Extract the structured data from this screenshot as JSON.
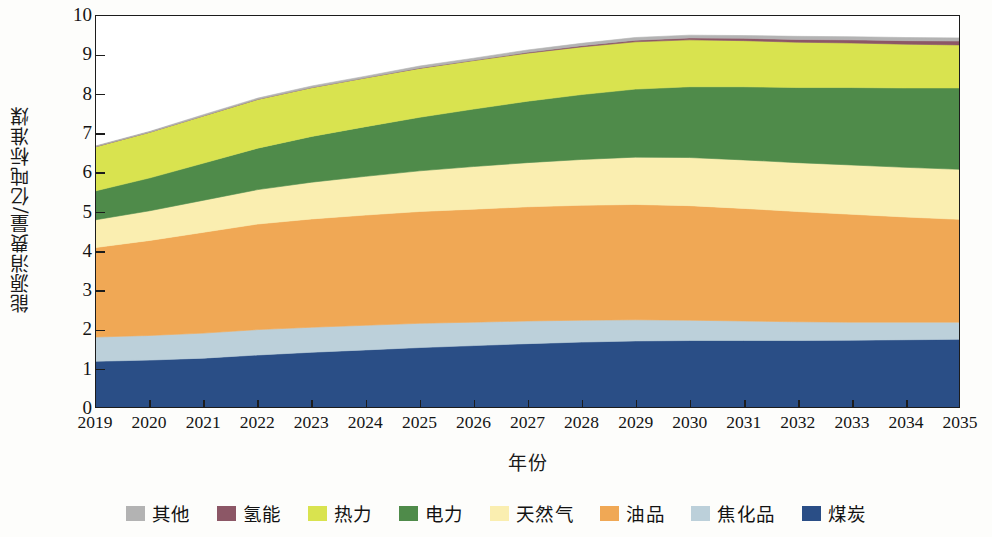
{
  "chart_data": {
    "type": "area",
    "title": "",
    "xlabel": "年份",
    "ylabel": "能源消费量/亿吨标准煤",
    "xlim": [
      2019,
      2035
    ],
    "ylim": [
      0,
      10
    ],
    "ytick_step": 1,
    "grid": false,
    "stacked": true,
    "legend_position": "bottom",
    "x": [
      2019,
      2020,
      2021,
      2022,
      2023,
      2024,
      2025,
      2026,
      2027,
      2028,
      2029,
      2030,
      2031,
      2032,
      2033,
      2034,
      2035
    ],
    "xtick_labels": [
      "2019",
      "2020",
      "2021",
      "2022",
      "2023",
      "2024",
      "2025",
      "2026",
      "2027",
      "2028",
      "2029",
      "2030",
      "2031",
      "2032",
      "2033",
      "2034",
      "2035"
    ],
    "ytick_labels": [
      "0",
      "1",
      "2",
      "3",
      "4",
      "5",
      "6",
      "7",
      "8",
      "9",
      "10"
    ],
    "stack_order_bottom_to_top": [
      "煤炭",
      "焦化品",
      "油品",
      "天然气",
      "电力",
      "热力",
      "氢能",
      "其他"
    ],
    "series": [
      {
        "name": "煤炭",
        "color": "#2a4e86",
        "values": [
          1.17,
          1.2,
          1.25,
          1.33,
          1.4,
          1.46,
          1.52,
          1.57,
          1.62,
          1.66,
          1.69,
          1.7,
          1.7,
          1.7,
          1.71,
          1.72,
          1.73
        ]
      },
      {
        "name": "焦化品",
        "color": "#bcd0da",
        "values": [
          0.62,
          0.63,
          0.64,
          0.65,
          0.64,
          0.63,
          0.62,
          0.6,
          0.58,
          0.56,
          0.54,
          0.52,
          0.5,
          0.48,
          0.46,
          0.45,
          0.44
        ]
      },
      {
        "name": "油品",
        "color": "#f0a855",
        "values": [
          2.29,
          2.43,
          2.58,
          2.7,
          2.77,
          2.82,
          2.86,
          2.89,
          2.92,
          2.94,
          2.95,
          2.93,
          2.88,
          2.82,
          2.76,
          2.69,
          2.63
        ]
      },
      {
        "name": "天然气",
        "color": "#faeeb0",
        "values": [
          0.71,
          0.76,
          0.82,
          0.88,
          0.94,
          0.99,
          1.04,
          1.09,
          1.13,
          1.17,
          1.21,
          1.23,
          1.24,
          1.25,
          1.26,
          1.27,
          1.28
        ]
      },
      {
        "name": "电力",
        "color": "#4f8b4a",
        "values": [
          0.74,
          0.84,
          0.95,
          1.06,
          1.17,
          1.27,
          1.37,
          1.47,
          1.57,
          1.66,
          1.74,
          1.81,
          1.87,
          1.92,
          1.98,
          2.03,
          2.08
        ]
      },
      {
        "name": "热力",
        "color": "#d9e34f",
        "values": [
          1.13,
          1.17,
          1.21,
          1.25,
          1.25,
          1.25,
          1.25,
          1.24,
          1.23,
          1.22,
          1.21,
          1.2,
          1.18,
          1.16,
          1.14,
          1.12,
          1.1
        ]
      },
      {
        "name": "氢能",
        "color": "#8c5766",
        "values": [
          0.0,
          0.0,
          0.0,
          0.0,
          0.0,
          0.0,
          0.01,
          0.01,
          0.02,
          0.03,
          0.04,
          0.05,
          0.06,
          0.07,
          0.08,
          0.09,
          0.1
        ]
      },
      {
        "name": "其他",
        "color": "#b3b3b3",
        "values": [
          0.02,
          0.02,
          0.03,
          0.03,
          0.04,
          0.04,
          0.05,
          0.05,
          0.06,
          0.06,
          0.07,
          0.07,
          0.07,
          0.08,
          0.08,
          0.08,
          0.08
        ]
      }
    ],
    "totals": [
      6.68,
      7.05,
      7.48,
      7.9,
      8.21,
      8.46,
      8.72,
      8.92,
      9.13,
      9.3,
      9.45,
      9.51,
      9.5,
      9.48,
      9.47,
      9.45,
      9.44
    ]
  },
  "legend": {
    "items": [
      {
        "label": "其他",
        "color": "#b3b3b3"
      },
      {
        "label": "氢能",
        "color": "#8c5766"
      },
      {
        "label": "热力",
        "color": "#d9e34f"
      },
      {
        "label": "电力",
        "color": "#4f8b4a"
      },
      {
        "label": "天然气",
        "color": "#faeeb0"
      },
      {
        "label": "油品",
        "color": "#f0a855"
      },
      {
        "label": "焦化品",
        "color": "#bcd0da"
      },
      {
        "label": "煤炭",
        "color": "#2a4e86"
      }
    ]
  },
  "axes": {
    "y_title": "能源消费量/亿吨标准煤",
    "x_title": "年份"
  }
}
